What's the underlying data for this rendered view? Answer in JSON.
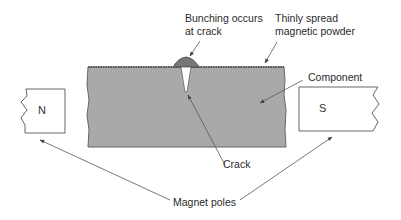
{
  "diagram": {
    "type": "magnetic-particle-inspection",
    "labels": {
      "bunching_line1": "Bunching occurs",
      "bunching_line2": "at crack",
      "powder_line1": "Thinly spread",
      "powder_line2": "magnetic powder",
      "component": "Component",
      "crack": "Crack",
      "magnet_poles": "Magnet poles"
    },
    "poles": {
      "north": "N",
      "south": "S"
    },
    "colors": {
      "component_fill": "#a9a9a9",
      "outline": "#555555",
      "arrow": "#555555"
    }
  }
}
